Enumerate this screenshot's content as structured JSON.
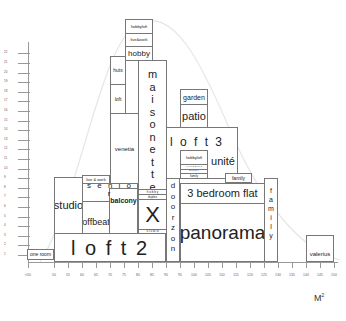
{
  "chart_data": {
    "type": "diagram",
    "title": "",
    "xlabel": "M²",
    "x_ticks": [
      "<50",
      "50",
      "55",
      "60",
      "65",
      "70",
      "75",
      "80",
      "85",
      "90",
      "95",
      "100",
      "105",
      "110",
      "115",
      "120",
      "125",
      "130",
      "135",
      "140",
      "145",
      "150"
    ],
    "y_ticks": [
      "1",
      "2",
      "3",
      "4",
      "5",
      "6",
      "7",
      "8",
      "9",
      "10",
      "11",
      "12",
      "13",
      "14",
      "15",
      "16",
      "17",
      "18",
      "19",
      "20",
      "21",
      "22"
    ],
    "blocks": [
      {
        "label": "one room"
      },
      {
        "label": "loft 2"
      },
      {
        "label": "studio"
      },
      {
        "label": "offbeat"
      },
      {
        "label": "balcony"
      },
      {
        "label": "senior"
      },
      {
        "label": "live & work"
      },
      {
        "label": "venetia"
      },
      {
        "label": "loft"
      },
      {
        "label": "huts"
      },
      {
        "label": "hobby"
      },
      {
        "label": "live&work"
      },
      {
        "label": "hobbyloft"
      },
      {
        "label": "maisonette"
      },
      {
        "label": "X"
      },
      {
        "label": "doorzon"
      },
      {
        "label": "loft 3"
      },
      {
        "label": "garden"
      },
      {
        "label": "patio"
      },
      {
        "label": "unité"
      },
      {
        "label": "hobbyloft"
      },
      {
        "label": "family"
      },
      {
        "label": "3 bedroom flat"
      },
      {
        "label": "panorama"
      },
      {
        "label": "family"
      },
      {
        "label": "valerius"
      }
    ]
  },
  "axis": {
    "unit": "M",
    "unit_sup": "2"
  },
  "blocks": {
    "one_room": "one room",
    "loft2": "l o f t  2",
    "studio": "studio",
    "offbeat": "offbeat",
    "balcony": "balcony",
    "senior": "s e n i o r",
    "livework_small": "live & work",
    "venetia": "venetia",
    "loft": "loft",
    "huts": "huts",
    "hobby": "hobby",
    "livework_top": "live&work",
    "hobbyloft_top": "hobbyloft",
    "maisonette": [
      "m",
      "a",
      "i",
      "s",
      "o",
      "n",
      "e",
      "t",
      "t",
      "e"
    ],
    "x": "X",
    "x_top1": "h o b b y",
    "x_top2": "duplex",
    "x_bottom": "s t u d i o",
    "doorzon": [
      "d",
      "o",
      "o",
      "r",
      "z",
      "o",
      "n"
    ],
    "loft3": "l o f t  3",
    "garden": "garden",
    "patio": "patio",
    "unite": "unité",
    "hobbyloft_mid": "hobbyloft",
    "mid_small1": "l i v e & w o r k",
    "mid_small2": "h o b b y",
    "mid_small3": "family",
    "family_small": "family",
    "three_bed": "3 bedroom flat",
    "panorama": "panorama",
    "family_vert": [
      "f",
      "a",
      "m",
      "i",
      "l",
      "y"
    ],
    "valerius": "valerius"
  }
}
